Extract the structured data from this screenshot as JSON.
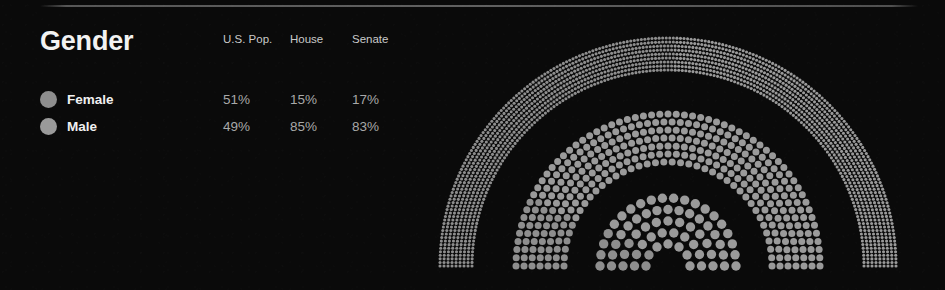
{
  "page": {
    "background_color": "#0a0a0a",
    "divider_color": "#969696"
  },
  "header": {
    "title": "Gender"
  },
  "table": {
    "columns": [
      "U.S. Pop.",
      "House",
      "Senate"
    ],
    "rows": [
      {
        "label": "Female",
        "swatch_color": "#8e8e8e",
        "values": [
          "51%",
          "15%",
          "17%"
        ]
      },
      {
        "label": "Male",
        "swatch_color": "#9a9a9a",
        "values": [
          "49%",
          "85%",
          "83%"
        ]
      }
    ]
  },
  "chart_data": {
    "type": "pie",
    "title": "Gender",
    "subtype": "concentric-semicircle-dot-arcs",
    "categories": [
      "Female",
      "Male"
    ],
    "series": [
      {
        "name": "U.S. Pop.",
        "ring": "outer",
        "values": [
          51,
          49
        ],
        "unit": "%",
        "dot_total": 1000,
        "dot_size_px": 3.1
      },
      {
        "name": "House",
        "ring": "middle",
        "values": [
          15,
          85
        ],
        "unit": "%",
        "dot_total": 435,
        "dot_size_px": 7.0
      },
      {
        "name": "Senate",
        "ring": "inner",
        "values": [
          17,
          83
        ],
        "unit": "%",
        "dot_total": 100,
        "dot_size_px": 9.4
      }
    ],
    "colors": {
      "Female": "#8e8e8e",
      "Male": "#9a9a9a"
    },
    "legend_position": "left",
    "grid": false,
    "xlabel": "",
    "ylabel": "",
    "annotations": []
  },
  "geometry": {
    "center_x": 270,
    "center_y": 254,
    "rings": [
      {
        "name": "outer",
        "r_inner": 196,
        "r_outer": 228,
        "rows": 9,
        "dot_r": 1.55,
        "gap": 3.55
      },
      {
        "name": "middle",
        "r_inner": 104,
        "r_outer": 152,
        "rows": 7,
        "dot_r": 3.5,
        "gap": 8.1
      },
      {
        "name": "inner",
        "r_inner": 22,
        "r_outer": 68,
        "rows": 5,
        "dot_r": 4.7,
        "gap": 10.6
      }
    ]
  }
}
